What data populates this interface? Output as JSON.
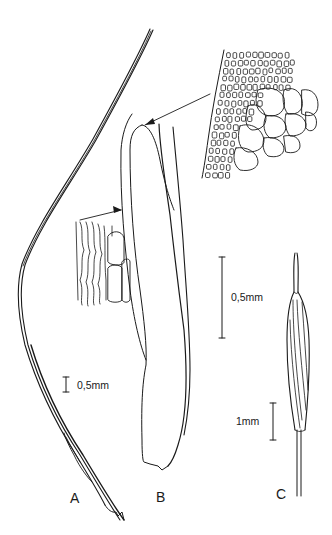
{
  "figure": {
    "panels": [
      {
        "id": "A",
        "label": "A",
        "description": "whole leaf"
      },
      {
        "id": "B",
        "label": "B",
        "description": "leaf base"
      },
      {
        "id": "C",
        "label": "C",
        "description": "capsule"
      }
    ],
    "scale_bars": {
      "a": "0,5mm",
      "b": "0,5mm",
      "c": "1mm"
    },
    "insets": [
      {
        "id": "upper",
        "description": "cell detail at leaf shoulder"
      },
      {
        "id": "lower",
        "description": "cell detail at leaf base"
      }
    ],
    "ink_color": "#1a1a1a",
    "background_color": "#ffffff"
  }
}
